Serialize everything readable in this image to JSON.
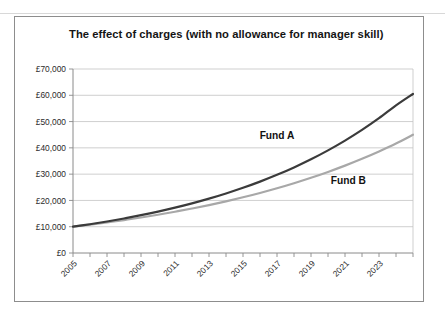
{
  "figure": {
    "title": "The effect of charges (with no allowance for manager skill)",
    "frame_border_color": "#8d8d8d",
    "background_color": "#ffffff"
  },
  "annotations": {
    "fund_a_label": "Fund A",
    "fund_b_label": "Fund B"
  },
  "chart_data": {
    "type": "line",
    "title": "The effect of charges (with no allowance for manager skill)",
    "xlabel": "",
    "ylabel": "",
    "grid": true,
    "legend_position": "inline-annotation",
    "xlim": [
      2005,
      2025
    ],
    "ylim": [
      0,
      70000
    ],
    "ytick_values": [
      0,
      10000,
      20000,
      30000,
      40000,
      50000,
      60000,
      70000
    ],
    "ytick_labels": [
      "£0",
      "£10,000",
      "£20,000",
      "£30,000",
      "£40,000",
      "£50,000",
      "£60,000",
      "£70,000"
    ],
    "x": [
      2005,
      2006,
      2007,
      2008,
      2009,
      2010,
      2011,
      2012,
      2013,
      2014,
      2015,
      2016,
      2017,
      2018,
      2019,
      2020,
      2021,
      2022,
      2023,
      2024,
      2025
    ],
    "xtick_values": [
      2005,
      2006,
      2007,
      2008,
      2009,
      2010,
      2011,
      2012,
      2013,
      2014,
      2015,
      2016,
      2017,
      2018,
      2019,
      2020,
      2021,
      2022,
      2023,
      2024,
      2025
    ],
    "xtick_labels": [
      "2005",
      "",
      "2007",
      "",
      "2009",
      "",
      "2011",
      "",
      "2013",
      "",
      "2015",
      "",
      "2017",
      "",
      "2019",
      "",
      "2021",
      "",
      "2023",
      "",
      ""
    ],
    "xtick_label_rotation": 45,
    "series": [
      {
        "name": "Fund A",
        "color": "#3b3b3b",
        "line_width": 2.2,
        "values": [
          10000,
          10950,
          11990,
          13130,
          14380,
          15750,
          17250,
          18890,
          20680,
          22650,
          24800,
          27160,
          29740,
          32570,
          35660,
          39050,
          42760,
          46820,
          51270,
          56140,
          60500
        ]
      },
      {
        "name": "Fund B",
        "color": "#a8a8a8",
        "line_width": 2.2,
        "values": [
          10000,
          10780,
          11620,
          12530,
          13510,
          14560,
          15700,
          16920,
          18240,
          19660,
          21190,
          22840,
          24620,
          26540,
          28610,
          30840,
          33240,
          35830,
          38630,
          41640,
          45000
        ]
      }
    ]
  }
}
